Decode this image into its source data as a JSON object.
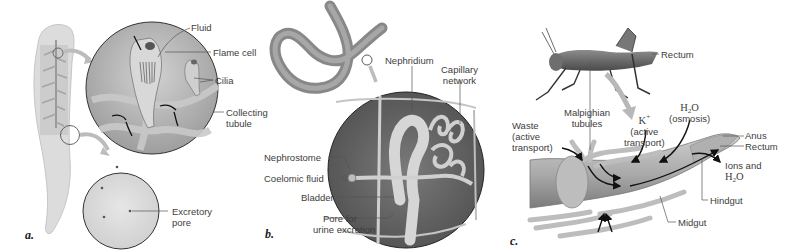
{
  "figure": {
    "panels": [
      {
        "letter": "a.",
        "organism": "flatworm",
        "labels": {
          "fluid": "Fluid",
          "flame_cell": "Flame cell",
          "cilia": "Cilia",
          "collecting_line1": "Collecting",
          "collecting_line2": "tubule",
          "excretory_line1": "Excretory",
          "excretory_line2": "pore"
        }
      },
      {
        "letter": "b.",
        "organism": "earthworm",
        "labels": {
          "nephridium": "Nephridium",
          "capillary_line1": "Capillary",
          "capillary_line2": "network",
          "nephrostome": "Nephrostome",
          "coelomic_fluid": "Coelomic fluid",
          "bladder": "Bladder",
          "pore_line1": "Pore for",
          "pore_line2": "urine excretion"
        }
      },
      {
        "letter": "c.",
        "organism": "insect",
        "labels": {
          "rectum_top": "Rectum",
          "malpighian_line1": "Malpighian",
          "malpighian_line2": "tubules",
          "waste_line1": "Waste",
          "waste_line2": "(active",
          "waste_line3": "transport)",
          "k_ion": "K",
          "k_sup": "+",
          "k_line2": "(active",
          "k_line3": "transport)",
          "h2o_h": "H",
          "h2o_sub": "2",
          "h2o_o": "O",
          "h2o_line2": "(osmosis)",
          "anus": "Anus",
          "rectum": "Rectum",
          "ions_line1": "Ions and",
          "ions_h": "H",
          "ions_sub": "2",
          "ions_o": "O",
          "hindgut": "Hindgut",
          "midgut": "Midgut"
        }
      }
    ]
  },
  "colors": {
    "background": "#ffffff",
    "label_text": "#3d3d3d",
    "leader_line": "#555555",
    "flatworm_body": "#d9d9d9",
    "circle_fill": "#bdbdbd",
    "earthworm": "#8f8f8f",
    "gut": "#a8a8a8",
    "arrow": "#111111"
  }
}
